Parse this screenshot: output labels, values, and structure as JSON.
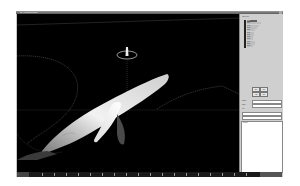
{
  "window": {
    "title": "3D Animation Editor"
  },
  "viewport": {
    "label": "Perspective",
    "model": "whale",
    "background": "#000000",
    "model_color": "#e8e8e8",
    "curve_color": "#6a6a6a",
    "gizmo_color": "#cfcfcf"
  },
  "panel": {
    "header": "Objects",
    "list_items": [
      {
        "label": "item",
        "selected": true
      },
      {
        "label": "item",
        "selected": false
      },
      {
        "label": "item",
        "selected": false
      },
      {
        "label": "item",
        "selected": false
      },
      {
        "label": "item",
        "selected": false
      },
      {
        "label": "item",
        "selected": false
      },
      {
        "label": "item",
        "selected": false
      },
      {
        "label": "item",
        "selected": false
      },
      {
        "label": "item",
        "selected": false
      },
      {
        "label": "item",
        "selected": false
      },
      {
        "label": "item",
        "selected": false
      },
      {
        "label": "item",
        "selected": false
      }
    ],
    "buttons": [
      {
        "label": "OK"
      },
      {
        "label": "Set"
      },
      {
        "label": "Add"
      },
      {
        "label": "Del"
      }
    ],
    "fields": [
      {
        "label": "Name",
        "value": ""
      },
      {
        "label": "Path",
        "value": ""
      },
      {
        "label": "Key",
        "value": ""
      }
    ],
    "log_lines": [
      "Output"
    ]
  },
  "timeline": {
    "current_frame": "0",
    "ticks": [
      "0",
      "10",
      "20",
      "30",
      "40",
      "50",
      "60",
      "70",
      "80",
      "90",
      "100",
      "110",
      "120",
      "130",
      "140",
      "150",
      "160",
      "170"
    ],
    "end_frame": ""
  }
}
